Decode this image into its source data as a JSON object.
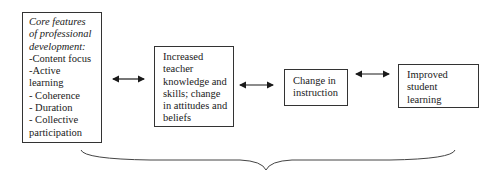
{
  "diagram": {
    "boxes": [
      {
        "id": "core-features",
        "lines_italic": [
          "Core features",
          "of professional",
          "development:"
        ],
        "lines": [
          "-Content focus",
          "-Active",
          "learning",
          "- Coherence",
          "- Duration",
          "- Collective",
          "participation"
        ]
      },
      {
        "id": "teacher-knowledge",
        "lines": [
          "Increased",
          "teacher",
          "knowledge and",
          "skills; change",
          "in attitudes and",
          "beliefs"
        ]
      },
      {
        "id": "change-instruction",
        "lines": [
          "Change in",
          "instruction"
        ]
      },
      {
        "id": "student-learning",
        "lines": [
          "Improved",
          "student",
          "learning"
        ]
      }
    ],
    "connectors": [
      {
        "from": "core-features",
        "to": "teacher-knowledge",
        "type": "bidirectional-arrow"
      },
      {
        "from": "teacher-knowledge",
        "to": "change-instruction",
        "type": "bidirectional-arrow"
      },
      {
        "from": "change-instruction",
        "to": "student-learning",
        "type": "bidirectional-arrow"
      }
    ],
    "brace": {
      "orientation": "horizontal-down",
      "spans": "all boxes"
    }
  }
}
